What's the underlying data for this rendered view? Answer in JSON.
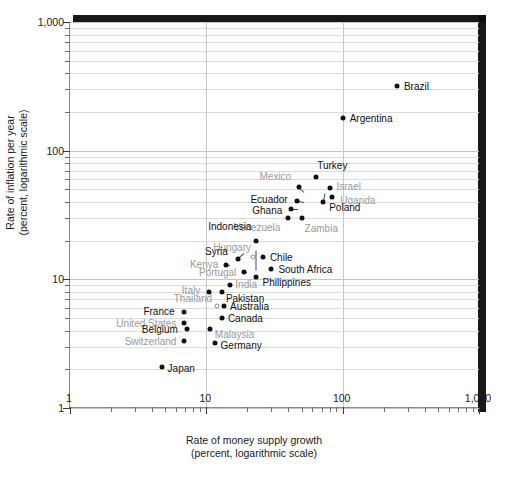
{
  "chart_data": {
    "type": "scatter",
    "title": "",
    "xlabel": "Rate of money supply growth",
    "xlabel_line2": "(percent, logarithmic scale)",
    "ylabel": "Rate of inflation per year",
    "ylabel_line2": "(percent, logarithmic scale)",
    "xscale": "log",
    "yscale": "log",
    "xlim": [
      1,
      1000
    ],
    "ylim": [
      1,
      1000
    ],
    "grid": true,
    "legend": "none",
    "xticks": [
      "1",
      "10",
      "100",
      "1,000"
    ],
    "yticks": [
      "1",
      "10",
      "100",
      "1,000"
    ],
    "xtick_values": [
      1,
      10,
      100,
      1000
    ],
    "ytick_values": [
      1,
      10,
      100,
      1000
    ],
    "marker_color": "#111111",
    "open_marker_color": "#8e8e8e",
    "points": [
      {
        "name": "Brazil",
        "x": 250,
        "y": 320,
        "lx": 7,
        "ly": 0,
        "dim": false,
        "open": false
      },
      {
        "name": "Argentina",
        "x": 100,
        "y": 180,
        "lx": 7,
        "ly": 0,
        "dim": false,
        "open": false
      },
      {
        "name": "Turkey",
        "x": 64,
        "y": 63,
        "lx": 1,
        "ly": -12,
        "dim": false,
        "open": false
      },
      {
        "name": "Israel",
        "x": 80,
        "y": 51,
        "lx": 7,
        "ly": -2,
        "dim": true,
        "open": false
      },
      {
        "name": "Uganda",
        "x": 84,
        "y": 44,
        "lx": 8,
        "ly": 3,
        "dim": true,
        "open": false
      },
      {
        "name": "Mexico",
        "x": 48,
        "y": 52,
        "lx": -8,
        "ly": -11,
        "dim": true,
        "open": false,
        "right": true
      },
      {
        "name": "Ecuador",
        "x": 46,
        "y": 41,
        "lx": -9,
        "ly": -2,
        "dim": false,
        "open": false,
        "right": true
      },
      {
        "name": "Poland",
        "x": 72,
        "y": 40,
        "lx": 6,
        "ly": 5,
        "dim": false,
        "open": false
      },
      {
        "name": "Ghana",
        "x": 42,
        "y": 35,
        "lx": -9,
        "ly": 1,
        "dim": false,
        "open": false,
        "right": true
      },
      {
        "name": "Zambia",
        "x": 50,
        "y": 30,
        "lx": 3,
        "ly": 10,
        "dim": true,
        "open": false
      },
      {
        "name": "Venezuela",
        "x": 40,
        "y": 30,
        "lx": -8,
        "ly": 9,
        "dim": true,
        "open": false,
        "right": true
      },
      {
        "name": "Indonesia",
        "x": 23,
        "y": 20,
        "lx": -4,
        "ly": -15,
        "dim": false,
        "open": false,
        "right": true
      },
      {
        "name": "Hungary",
        "x": 22,
        "y": 15,
        "lx": -2,
        "ly": -10,
        "dim": true,
        "open": true,
        "right": true
      },
      {
        "name": "Chile",
        "x": 26,
        "y": 15,
        "lx": 7,
        "ly": 0,
        "dim": false,
        "open": false
      },
      {
        "name": "Syria",
        "x": 17,
        "y": 14.5,
        "lx": -10,
        "ly": -8,
        "dim": false,
        "open": false,
        "right": true
      },
      {
        "name": "Kenya",
        "x": 14,
        "y": 13,
        "lx": -8,
        "ly": -1,
        "dim": true,
        "open": false,
        "right": true
      },
      {
        "name": "South Africa",
        "x": 30,
        "y": 12,
        "lx": 7,
        "ly": 0,
        "dim": false,
        "open": false
      },
      {
        "name": "Portugal",
        "x": 19,
        "y": 11.5,
        "lx": -8,
        "ly": 0,
        "dim": true,
        "open": false,
        "right": true
      },
      {
        "name": "Philippines",
        "x": 23,
        "y": 10.5,
        "lx": 7,
        "ly": 5,
        "dim": false,
        "open": false
      },
      {
        "name": "India",
        "x": 15,
        "y": 9,
        "lx": 5,
        "ly": -1,
        "dim": true,
        "open": false
      },
      {
        "name": "Pakistan",
        "x": 13,
        "y": 8,
        "lx": 4,
        "ly": 6,
        "dim": false,
        "open": false
      },
      {
        "name": "Italy",
        "x": 10.5,
        "y": 8,
        "lx": -9,
        "ly": -2,
        "dim": true,
        "open": false,
        "right": true
      },
      {
        "name": "Thailand",
        "x": 12,
        "y": 6.2,
        "lx": -5,
        "ly": -8,
        "dim": true,
        "open": true,
        "right": true
      },
      {
        "name": "Australia",
        "x": 13.5,
        "y": 6.2,
        "lx": 6,
        "ly": 0,
        "dim": false,
        "open": false
      },
      {
        "name": "France",
        "x": 6.8,
        "y": 5.6,
        "lx": -9,
        "ly": -1,
        "dim": false,
        "open": false,
        "right": true
      },
      {
        "name": "Canada",
        "x": 13,
        "y": 5.0,
        "lx": 6,
        "ly": 0,
        "dim": false,
        "open": false
      },
      {
        "name": "United States",
        "x": 6.9,
        "y": 4.6,
        "lx": -8,
        "ly": 0,
        "dim": true,
        "open": false,
        "right": true
      },
      {
        "name": "Belgium",
        "x": 7.2,
        "y": 4.1,
        "lx": -9,
        "ly": 0,
        "dim": false,
        "open": false,
        "right": true
      },
      {
        "name": "Malaysia",
        "x": 10.6,
        "y": 4.1,
        "lx": 5,
        "ly": 5,
        "dim": true,
        "open": false
      },
      {
        "name": "Switzerland",
        "x": 6.9,
        "y": 3.3,
        "lx": -8,
        "ly": 0,
        "dim": true,
        "open": false,
        "right": true
      },
      {
        "name": "Germany",
        "x": 11.5,
        "y": 3.2,
        "lx": 6,
        "ly": 2,
        "dim": false,
        "open": false
      },
      {
        "name": "Japan",
        "x": 4.7,
        "y": 2.1,
        "lx": 6,
        "ly": 1,
        "dim": false,
        "open": false
      }
    ],
    "leaders": [
      {
        "from": "Mexico",
        "x1": 52,
        "y1": 48,
        "x2": 48,
        "y2": 52
      },
      {
        "from": "Ecuador",
        "x1": 52,
        "y1": 40,
        "x2": 46,
        "y2": 41
      },
      {
        "from": "Ghana",
        "x1": 47,
        "y1": 35,
        "x2": 42,
        "y2": 35
      },
      {
        "from": "Poland",
        "x1": 74,
        "y1": 47,
        "x2": 72,
        "y2": 40
      },
      {
        "from": "Syria",
        "x1": 19,
        "y1": 16,
        "x2": 17,
        "y2": 14.5
      },
      {
        "from": "Indonesia",
        "x1": 23,
        "y1": 17,
        "x2": 23,
        "y2": 12
      },
      {
        "from": "Kenya",
        "x1": 15,
        "y1": 13,
        "x2": 14,
        "y2": 13
      },
      {
        "from": "Portugal",
        "x1": 20,
        "y1": 11.5,
        "x2": 19,
        "y2": 11.5
      }
    ]
  }
}
